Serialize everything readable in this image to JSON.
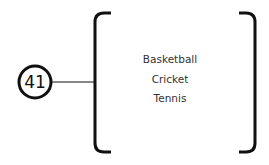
{
  "node": {
    "number": "41"
  },
  "group": {
    "items": [
      {
        "label": "Basketball"
      },
      {
        "label": "Cricket"
      },
      {
        "label": "Tennis"
      }
    ]
  },
  "colors": {
    "stroke": "#111111",
    "text": "#333333",
    "background": "#ffffff"
  }
}
